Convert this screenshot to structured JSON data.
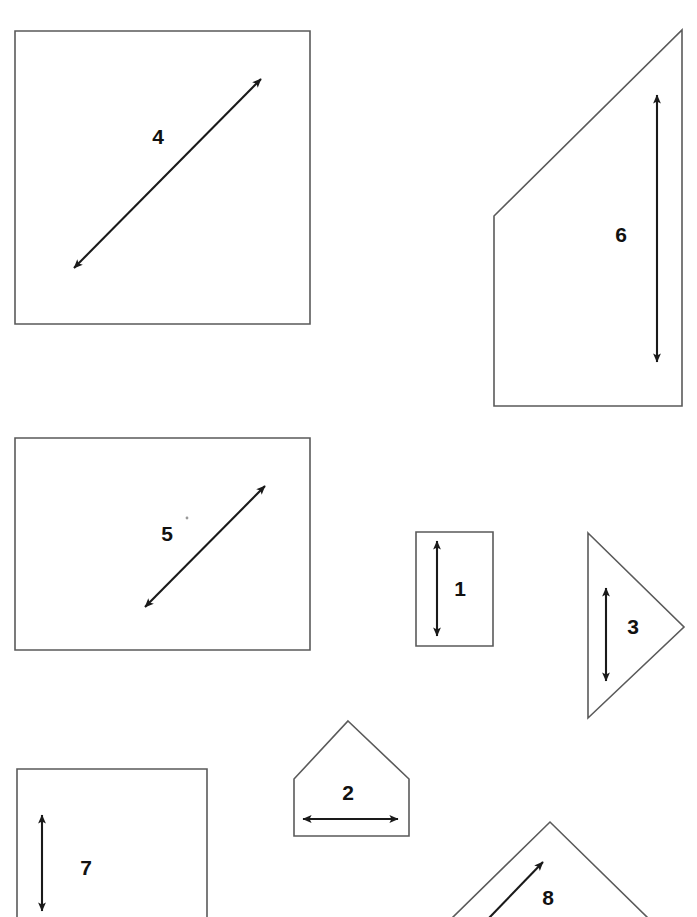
{
  "page": {
    "background_color": "#ffffff",
    "outline_color": "#5a5a5a",
    "arrow_color": "#1a1a1a",
    "label_color": "#111111",
    "width": 697,
    "height": 917
  },
  "figures": [
    {
      "id": "figure-4",
      "label": "4",
      "shape": "square",
      "label_x": 158,
      "label_y": 138,
      "outline_points": "15,31 310,31 310,324 15,324",
      "arrow": {
        "orientation": "diagonal-up-right",
        "x1": 74,
        "y1": 268,
        "x2": 261,
        "y2": 79,
        "heads": "both"
      }
    },
    {
      "id": "figure-6",
      "label": "6",
      "shape": "right-trapezoid",
      "label_x": 621,
      "label_y": 236,
      "outline_points": "682,30 682,406 494,406 494,216",
      "arrow": {
        "orientation": "vertical",
        "x1": 657,
        "y1": 362,
        "x2": 657,
        "y2": 95,
        "heads": "both"
      }
    },
    {
      "id": "figure-5",
      "label": "5",
      "shape": "rectangle",
      "label_x": 167,
      "label_y": 535,
      "outline_points": "15,438 310,438 310,650 15,650",
      "arrow": {
        "orientation": "diagonal-up-right",
        "x1": 145,
        "y1": 607,
        "x2": 265,
        "y2": 486,
        "heads": "both"
      }
    },
    {
      "id": "figure-1",
      "label": "1",
      "shape": "rectangle",
      "label_x": 460,
      "label_y": 590,
      "outline_points": "416,532 493,532 493,646 416,646",
      "arrow": {
        "orientation": "vertical",
        "x1": 437,
        "y1": 636,
        "x2": 437,
        "y2": 541,
        "heads": "both"
      }
    },
    {
      "id": "figure-3",
      "label": "3",
      "shape": "triangle-right-pointing",
      "label_x": 633,
      "label_y": 628,
      "outline_points": "588,533 684,627 588,718",
      "arrow": {
        "orientation": "vertical",
        "x1": 606,
        "y1": 681,
        "x2": 606,
        "y2": 588,
        "heads": "both"
      }
    },
    {
      "id": "figure-2",
      "label": "2",
      "shape": "pentagon-house",
      "label_x": 348,
      "label_y": 794,
      "outline_points": "348,721 409,779 409,836 294,836 294,779",
      "arrow": {
        "orientation": "horizontal",
        "x1": 303,
        "y1": 819,
        "x2": 398,
        "y2": 819,
        "heads": "both"
      }
    },
    {
      "id": "figure-7",
      "label": "7",
      "shape": "rectangle-cropped",
      "label_x": 86,
      "label_y": 869,
      "outline_points": "17,769 207,769 207,917 17,917",
      "arrow": {
        "orientation": "vertical",
        "x1": 42,
        "y1": 911,
        "x2": 42,
        "y2": 815,
        "heads": "both"
      }
    },
    {
      "id": "figure-8",
      "label": "8",
      "shape": "chevron-cropped",
      "label_x": 548,
      "label_y": 899,
      "outline_points": "452,917 550,822 648,917",
      "arrow": {
        "orientation": "diagonal-up-right",
        "x1": 489,
        "y1": 916,
        "x2": 543,
        "y2": 862,
        "heads": "single-end"
      }
    }
  ],
  "marks": [
    {
      "id": "stray-speck",
      "x": 187,
      "y": 518,
      "r": 1.4
    }
  ]
}
